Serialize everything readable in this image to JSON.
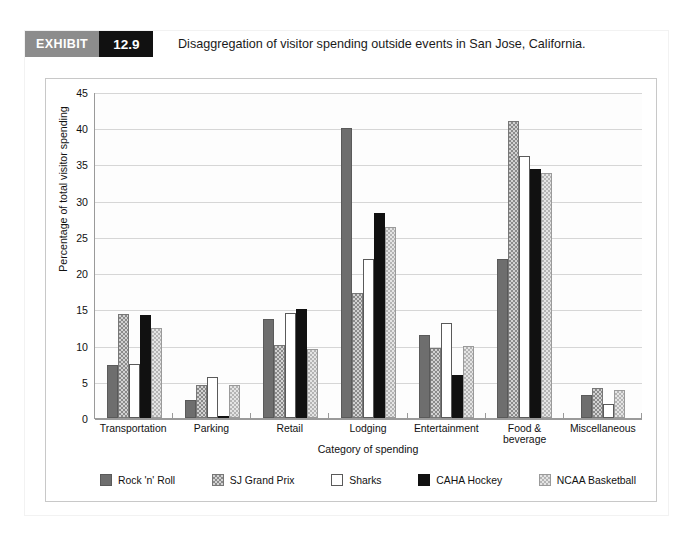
{
  "exhibit": {
    "tag": "EXHIBIT",
    "number": "12.9",
    "caption": "Disaggregation of visitor spending outside events in San Jose, California."
  },
  "chart_data": {
    "type": "bar",
    "title": "",
    "xlabel": "Category of spending",
    "ylabel": "Percentage of total visitor spending",
    "ylim": [
      0,
      45
    ],
    "yticks": [
      0,
      5,
      10,
      15,
      20,
      25,
      30,
      35,
      40,
      45
    ],
    "grid": true,
    "legend_position": "bottom",
    "categories": [
      "Transportation",
      "Parking",
      "Retail",
      "Lodging",
      "Entertainment",
      "Food & beverage",
      "Miscellaneous"
    ],
    "series": [
      {
        "name": "Rock 'n' Roll",
        "color": "#6e6e6e",
        "values": [
          7.3,
          2.5,
          13.7,
          40.0,
          11.5,
          21.9,
          3.2
        ]
      },
      {
        "name": "SJ Grand Prix",
        "color": "#8a8a8a",
        "values": [
          14.4,
          4.5,
          10.1,
          17.2,
          9.6,
          41.0,
          4.2
        ]
      },
      {
        "name": "Sharks",
        "color": "#ffffff",
        "values": [
          7.4,
          5.6,
          14.5,
          21.9,
          13.1,
          36.2,
          2.0
        ]
      },
      {
        "name": "CAHA Hockey",
        "color": "#111111",
        "values": [
          14.2,
          0.3,
          15.0,
          28.3,
          6.0,
          34.4,
          0.0
        ]
      },
      {
        "name": "NCAA Basketball",
        "color": "#b4b4b4",
        "values": [
          12.4,
          4.6,
          9.5,
          26.4,
          10.0,
          33.8,
          3.8
        ]
      }
    ]
  }
}
